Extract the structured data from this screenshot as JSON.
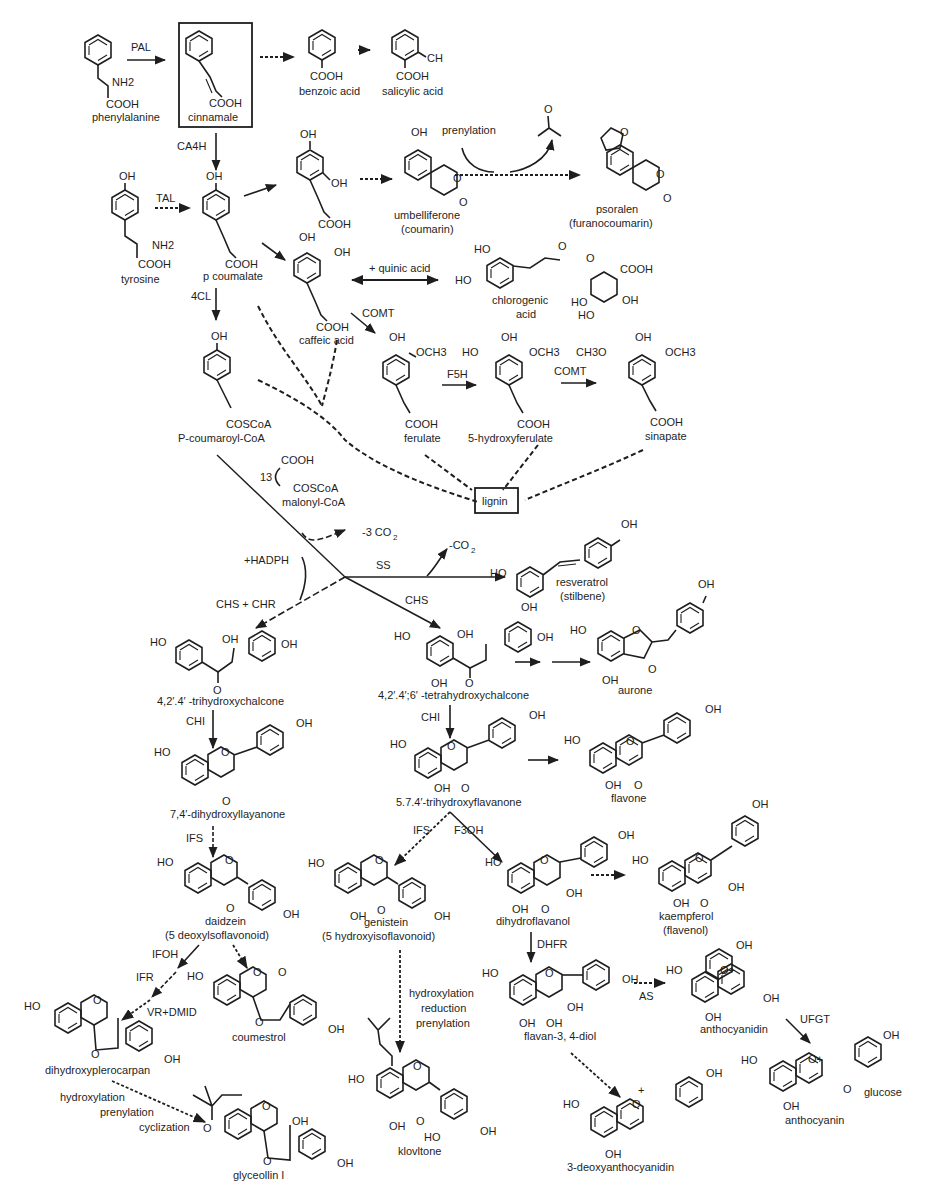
{
  "compounds": {
    "phenylalanine": {
      "name": "phenylalanine",
      "groups": [
        "NH2",
        "COOH"
      ]
    },
    "cinnamate": {
      "name": "cinnamale",
      "groups": [
        "COOH"
      ]
    },
    "benzoic_acid": {
      "name": "benzoic acid",
      "groups": [
        "COOH"
      ]
    },
    "salicylic_acid": {
      "name": "salicylic acid",
      "groups": [
        "CH",
        "COOH"
      ]
    },
    "tyrosine": {
      "name": "tyrosine",
      "groups": [
        "OH",
        "NH2",
        "COOH"
      ]
    },
    "p_coumarate": {
      "name": "p coumalate",
      "groups": [
        "OH",
        "COOH"
      ]
    },
    "dihydroxycinnamic": {
      "name": "",
      "groups": [
        "OH",
        "OH",
        "COOH"
      ]
    },
    "umbelliferone": {
      "name": "umbelliferone",
      "class": "(coumarin)",
      "groups": [
        "OH",
        "O",
        "O"
      ]
    },
    "psoralen": {
      "name": "psoralen",
      "class": "(furanocoumarin)",
      "groups": [
        "O",
        "O",
        "O"
      ]
    },
    "acetone": {
      "groups": [
        "O"
      ]
    },
    "caffeic_acid": {
      "name": "caffeic acid",
      "groups": [
        "OH",
        "OH",
        "COOH"
      ]
    },
    "chlorogenic_acid": {
      "name": "chlorogenic",
      "name2": "acid",
      "groups": [
        "HO",
        "HO",
        "O",
        "O",
        "COOH",
        "HO",
        "HO",
        "OH"
      ]
    },
    "p_coumaroyl_coa": {
      "name": "P-coumaroyl-CoA",
      "groups": [
        "OH",
        "COSCoA"
      ]
    },
    "ferulate": {
      "name": "ferulate",
      "groups": [
        "OH",
        "OCH3",
        "COOH"
      ]
    },
    "hydroxyferulate": {
      "name": "5-hydroxyferulate",
      "groups": [
        "HO",
        "OH",
        "OCH3",
        "COOH"
      ]
    },
    "sinapate": {
      "name": "sinapate",
      "groups": [
        "CH3O",
        "OH",
        "OCH3",
        "COOH"
      ]
    },
    "lignin": {
      "name": "lignin"
    },
    "malonyl_coa": {
      "name": "malonyl-CoA",
      "count": "13",
      "groups": [
        "COOH",
        "COSCoA"
      ]
    },
    "resveratrol": {
      "name": "resveratrol",
      "class": "(stilbene)",
      "groups": [
        "HO",
        "OH",
        "OH"
      ]
    },
    "trihydroxychalcone": {
      "name": "4,2′.4′ -trihydroxychalcone",
      "groups": [
        "HO",
        "OH",
        "OH",
        "O"
      ]
    },
    "tetrahydroxychalcone": {
      "name": "4,2′.4′;6′ -tetrahydroxychalcone",
      "groups": [
        "HO",
        "OH",
        "OH",
        "OH",
        "O"
      ]
    },
    "aurone": {
      "name": "aurone",
      "groups": [
        "HO",
        "O",
        "OH",
        "O"
      ]
    },
    "dihydroxyflavanone": {
      "name": "7,4′-dihydroxyllayanone",
      "groups": [
        "HO",
        "O",
        "OH",
        "O"
      ]
    },
    "trihydroxyflavanone": {
      "name": "5.7.4′-trihydroxyflavanone",
      "groups": [
        "HO",
        "O",
        "OH",
        "OH",
        "O"
      ]
    },
    "flavone": {
      "name": "flavone",
      "groups": [
        "HO",
        "O",
        "OH",
        "OH",
        "O"
      ]
    },
    "daidzein": {
      "name": "daidzein",
      "class": "(5 deoxylsoflavonoid)",
      "groups": [
        "HO",
        "O",
        "O",
        "OH"
      ]
    },
    "genistein": {
      "name": "genistein",
      "class": "(5 hydroxyisoflavonoid)",
      "groups": [
        "HO",
        "O",
        "OH",
        "O",
        "OH"
      ]
    },
    "dihydroflavanol": {
      "name": "dihydroflavanol",
      "groups": [
        "HO",
        "O",
        "OH",
        "OH",
        "OH",
        "O"
      ]
    },
    "kaempferol": {
      "name": "kaempferol",
      "class": "(flavenol)",
      "groups": [
        "OH",
        "HO",
        "O",
        "OH",
        "OH",
        "O"
      ]
    },
    "coumestrol": {
      "name": "coumestrol",
      "groups": [
        "HO",
        "O",
        "O",
        "O",
        "OH"
      ]
    },
    "dihydroxypterocarpan": {
      "name": "dihydroxyplerocarpan",
      "groups": [
        "HO",
        "O",
        "O",
        "OH"
      ]
    },
    "flavan_diol": {
      "name": "flavan-3, 4-diol",
      "groups": [
        "HO",
        "O",
        "OH",
        "OH",
        "OH",
        "OH"
      ]
    },
    "anthocyanidin": {
      "name": "anthocyanidin",
      "groups": [
        "OH",
        "HO",
        "O+",
        "OH",
        "OH"
      ]
    },
    "anthocyanin": {
      "name": "anthocyanin",
      "groups": [
        "OH",
        "HO",
        "O+",
        "O",
        "glucose",
        "OH"
      ]
    },
    "kievitone": {
      "name": "klovltone",
      "groups": [
        "HO",
        "O",
        "OH",
        "O",
        "HO",
        "OH"
      ]
    },
    "glyceollin": {
      "name": "glyceollin I",
      "groups": [
        "O",
        "O",
        "OH",
        "O",
        "OH"
      ]
    },
    "deoxyanthocyanidin": {
      "name": "3-deoxyanthocyanidin",
      "groups": [
        "+",
        "OH",
        "HO",
        "O",
        "OH"
      ]
    }
  },
  "enzymes": {
    "pal": "PAL",
    "ca4h": "CA4H",
    "tal": "TAL",
    "cl4": "4CL",
    "comt1": "COMT",
    "f5h": "F5H",
    "comt2": "COMT",
    "ss": "SS",
    "chs": "CHS",
    "chs_chr": "CHS + CHR",
    "chi1": "CHI",
    "chi2": "CHI",
    "ifs1": "IFS",
    "ifs2": "IFS",
    "f3oh": "F3OH",
    "dhfr": "DHFR",
    "as": "AS",
    "ufgt": "UFGT",
    "ifoh": "IFOH",
    "ifr": "IFR",
    "vr_dmid": "VR+DMID"
  },
  "annotations": {
    "prenylation": "prenylation",
    "quinic_acid": "+ quinic acid",
    "minus_3co2": "-3 CO",
    "minus_3co2_sub": "2",
    "minus_co2": "-CO",
    "minus_co2_sub": "2",
    "hadph": "+HADPH",
    "kievitone_steps": [
      "hydroxylation",
      "reduction",
      "prenylation"
    ],
    "glyceollin_steps": [
      "hydroxylation",
      "prenylation",
      "cyclization"
    ]
  }
}
